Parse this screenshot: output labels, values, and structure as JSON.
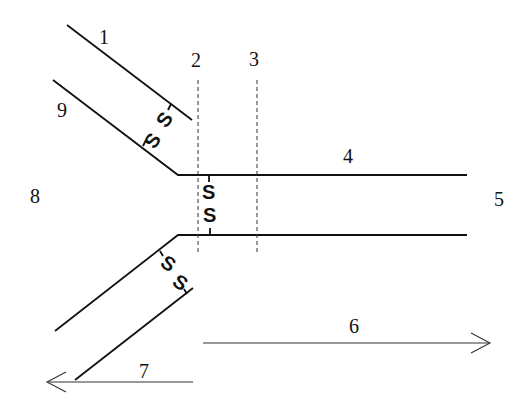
{
  "diagram": {
    "type": "schematic",
    "labels": {
      "l1": "1",
      "l2": "2",
      "l3": "3",
      "l4": "4",
      "l5": "5",
      "l6": "6",
      "l7": "7",
      "l8": "8",
      "l9": "9"
    },
    "springs": {
      "upper_diagonal": [
        "S",
        "S"
      ],
      "center_vertical": [
        "S",
        "S"
      ],
      "lower_diagonal": [
        "S",
        "S"
      ]
    },
    "arrows": {
      "arrow_6": "right",
      "arrow_7": "left"
    }
  }
}
